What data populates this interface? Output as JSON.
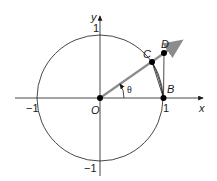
{
  "diagram": {
    "axes": {
      "x_label": "x",
      "y_label": "y",
      "tick_labels": {
        "x_neg": "−1",
        "x_pos": "1",
        "y_pos": "1",
        "y_neg": "−1"
      }
    },
    "points": {
      "O": "O",
      "B": "B",
      "C": "C",
      "D": "D"
    },
    "angle_label": "θ",
    "colors": {
      "ray": "#8c8c8c",
      "lines": "#1a1a1a",
      "points": "#000000"
    }
  }
}
